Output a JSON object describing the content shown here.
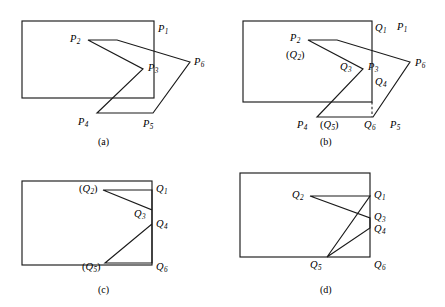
{
  "figure": {
    "kind": "polygon-clipping-illustration",
    "width": 445,
    "height": 307,
    "background_color": "#ffffff",
    "stroke_color": "#1a1a1a",
    "text_color": "#000000"
  },
  "panels": [
    {
      "id": "a",
      "caption": "(a)",
      "caption_pos": {
        "x": 98,
        "y": 137
      },
      "origin": {
        "x": 0,
        "y": 0
      },
      "clip_rect": {
        "x": 22,
        "y": 21,
        "width": 132,
        "height": 77
      },
      "subject_polygon": {
        "name": "arrow-polygon",
        "closed": true,
        "points": "117,40 88,40 143,69 97,113 153,113 190,62"
      },
      "dashed_segments": [],
      "labels": [
        {
          "name": "label-p1",
          "base": "P",
          "sub": "1",
          "paren": false,
          "x": 158,
          "y": 24
        },
        {
          "name": "label-p2",
          "base": "P",
          "sub": "2",
          "paren": false,
          "x": 70,
          "y": 34
        },
        {
          "name": "label-p3",
          "base": "P",
          "sub": "3",
          "paren": false,
          "x": 148,
          "y": 63
        },
        {
          "name": "label-p4",
          "base": "P",
          "sub": "4",
          "paren": false,
          "x": 78,
          "y": 117
        },
        {
          "name": "label-p5",
          "base": "P",
          "sub": "5",
          "paren": false,
          "x": 143,
          "y": 119
        },
        {
          "name": "label-p6",
          "base": "P",
          "sub": "6",
          "paren": false,
          "x": 194,
          "y": 57
        }
      ]
    },
    {
      "id": "b",
      "caption": "(b)",
      "caption_pos": {
        "x": 320,
        "y": 137
      },
      "origin": {
        "x": 0,
        "y": 0
      },
      "clip_rect": {
        "x": 243,
        "y": 21,
        "width": 129,
        "height": 81
      },
      "subject_polygon": {
        "name": "arrow-polygon",
        "closed": true,
        "points": "337,40 308,40 363,69 317,117 373,117 410,62"
      },
      "dashed_segments": [
        {
          "name": "q6-dashed-edge",
          "x1": 372,
          "y1": 102,
          "x2": 372,
          "y2": 117
        }
      ],
      "labels": [
        {
          "name": "label-q1",
          "base": "Q",
          "sub": "1",
          "paren": false,
          "x": 375,
          "y": 23
        },
        {
          "name": "label-p1",
          "base": "P",
          "sub": "1",
          "paren": false,
          "x": 397,
          "y": 22
        },
        {
          "name": "label-p2",
          "base": "P",
          "sub": "2",
          "paren": false,
          "x": 290,
          "y": 33
        },
        {
          "name": "label-q2",
          "base": "Q",
          "sub": "2",
          "paren": true,
          "x": 286,
          "y": 50
        },
        {
          "name": "label-q3",
          "base": "Q",
          "sub": "3",
          "paren": false,
          "x": 340,
          "y": 62
        },
        {
          "name": "label-p3",
          "base": "P",
          "sub": "3",
          "paren": false,
          "x": 368,
          "y": 62
        },
        {
          "name": "label-q4",
          "base": "Q",
          "sub": "4",
          "paren": false,
          "x": 375,
          "y": 77
        },
        {
          "name": "label-p6",
          "base": "P",
          "sub": "6",
          "paren": false,
          "x": 415,
          "y": 58
        },
        {
          "name": "label-p4",
          "base": "P",
          "sub": "4",
          "paren": false,
          "x": 297,
          "y": 120
        },
        {
          "name": "label-q5",
          "base": "Q",
          "sub": "5",
          "paren": true,
          "x": 320,
          "y": 120
        },
        {
          "name": "label-q6",
          "base": "Q",
          "sub": "6",
          "paren": false,
          "x": 364,
          "y": 120
        },
        {
          "name": "label-p5",
          "base": "P",
          "sub": "5",
          "paren": false,
          "x": 390,
          "y": 120
        }
      ]
    },
    {
      "id": "c",
      "caption": "(c)",
      "caption_pos": {
        "x": 98,
        "y": 285
      },
      "origin": {
        "x": 0,
        "y": 0
      },
      "clip_rect": {
        "x": 22,
        "y": 181,
        "width": 130,
        "height": 84
      },
      "subject_polygon": {
        "name": "clipped-polygon",
        "closed": true,
        "points": "152,190 103,190 152,210 152,224 105,263 152,263"
      },
      "dashed_segments": [],
      "labels": [
        {
          "name": "label-q2",
          "base": "Q",
          "sub": "2",
          "paren": true,
          "x": 79,
          "y": 184
        },
        {
          "name": "label-q1",
          "base": "Q",
          "sub": "1",
          "paren": false,
          "x": 156,
          "y": 184
        },
        {
          "name": "label-q3",
          "base": "Q",
          "sub": "3",
          "paren": false,
          "x": 134,
          "y": 209
        },
        {
          "name": "label-q4",
          "base": "Q",
          "sub": "4",
          "paren": false,
          "x": 156,
          "y": 219
        },
        {
          "name": "label-q5",
          "base": "Q",
          "sub": "5",
          "paren": true,
          "x": 82,
          "y": 262
        },
        {
          "name": "label-q6",
          "base": "Q",
          "sub": "6",
          "paren": false,
          "x": 156,
          "y": 262
        }
      ]
    },
    {
      "id": "d",
      "caption": "(d)",
      "caption_pos": {
        "x": 320,
        "y": 285
      },
      "origin": {
        "x": 0,
        "y": 0
      },
      "clip_rect": {
        "x": 240,
        "y": 173,
        "width": 130,
        "height": 84
      },
      "subject_polygon": {
        "name": "clipped-polygon",
        "closed": true,
        "points": "370,196 310,196 370,218 370,228 327,257"
      },
      "dashed_segments": [],
      "labels": [
        {
          "name": "label-q2",
          "base": "Q",
          "sub": "2",
          "paren": false,
          "x": 292,
          "y": 190
        },
        {
          "name": "label-q1",
          "base": "Q",
          "sub": "1",
          "paren": false,
          "x": 374,
          "y": 190
        },
        {
          "name": "label-q3",
          "base": "Q",
          "sub": "3",
          "paren": false,
          "x": 374,
          "y": 212
        },
        {
          "name": "label-q4",
          "base": "Q",
          "sub": "4",
          "paren": false,
          "x": 374,
          "y": 224
        },
        {
          "name": "label-q5",
          "base": "Q",
          "sub": "5",
          "paren": false,
          "x": 310,
          "y": 260
        },
        {
          "name": "label-q6",
          "base": "Q",
          "sub": "6",
          "paren": false,
          "x": 374,
          "y": 260
        }
      ]
    }
  ]
}
